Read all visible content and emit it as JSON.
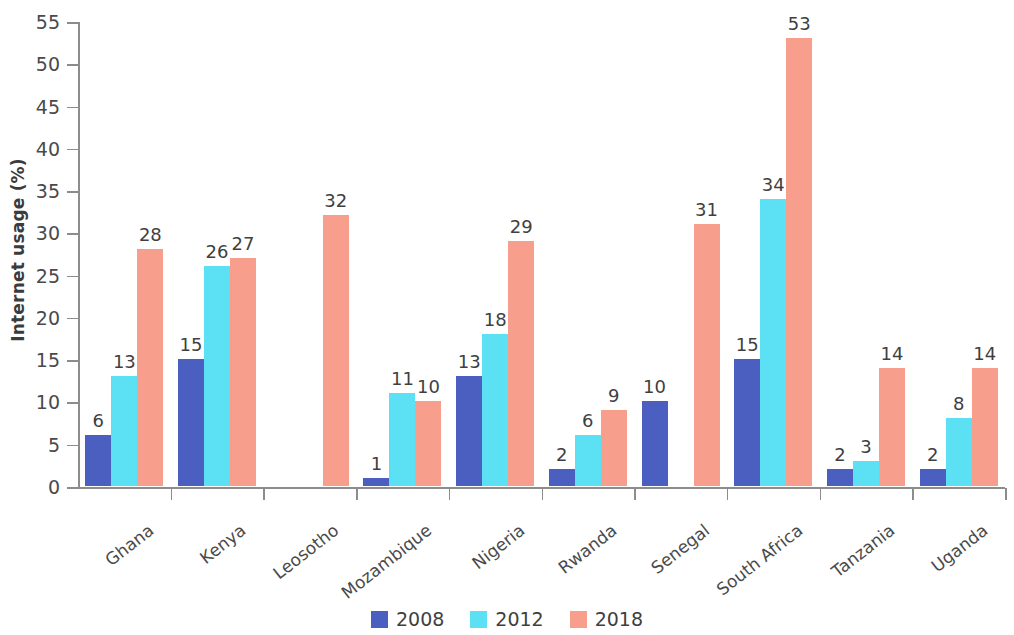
{
  "chart_data": {
    "type": "bar",
    "title": "",
    "xlabel": "",
    "ylabel": "Internet usage (%)",
    "ylim": [
      0,
      55
    ],
    "yticks": [
      0,
      5,
      10,
      15,
      20,
      25,
      30,
      35,
      40,
      45,
      50,
      55
    ],
    "grid": false,
    "legend_position": "bottom-center",
    "categories": [
      "Ghana",
      "Kenya",
      "Leosotho",
      "Mozambique",
      "Nigeria",
      "Rwanda",
      "Senegal",
      "South Africa",
      "Tanzania",
      "Uganda"
    ],
    "series": [
      {
        "name": "2008",
        "color": "#4a5fc0",
        "values": [
          6,
          15,
          null,
          1,
          13,
          2,
          10,
          15,
          2,
          2
        ]
      },
      {
        "name": "2012",
        "color": "#5ce0f3",
        "values": [
          13,
          26,
          null,
          11,
          18,
          6,
          null,
          34,
          3,
          8
        ]
      },
      {
        "name": "2018",
        "color": "#f79e8c",
        "values": [
          28,
          27,
          32,
          10,
          29,
          9,
          31,
          53,
          14,
          14
        ]
      }
    ]
  },
  "axis": {
    "y_title": "Internet usage (%)",
    "tick_labels": [
      "0",
      "5",
      "10",
      "15",
      "20",
      "25",
      "30",
      "35",
      "40",
      "45",
      "50",
      "55"
    ]
  },
  "legend": {
    "items": [
      {
        "label": "2008",
        "color": "#4a5fc0"
      },
      {
        "label": "2012",
        "color": "#5ce0f3"
      },
      {
        "label": "2018",
        "color": "#f79e8c"
      }
    ]
  }
}
